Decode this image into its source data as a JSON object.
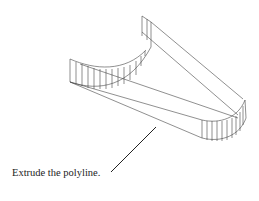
{
  "figure": {
    "stroke_color": "#333333",
    "leader_color": "#222222"
  },
  "caption": {
    "text": "Extrude the polyline."
  }
}
